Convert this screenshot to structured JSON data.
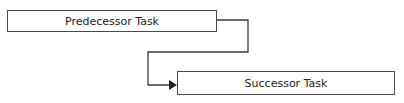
{
  "diagram": {
    "type": "finish-to-start dependency",
    "predecessor": {
      "label": "Predecessor Task"
    },
    "successor": {
      "label": "Successor Task"
    },
    "connector": {
      "color": "#333333",
      "arrowhead": "filled-triangle"
    }
  }
}
